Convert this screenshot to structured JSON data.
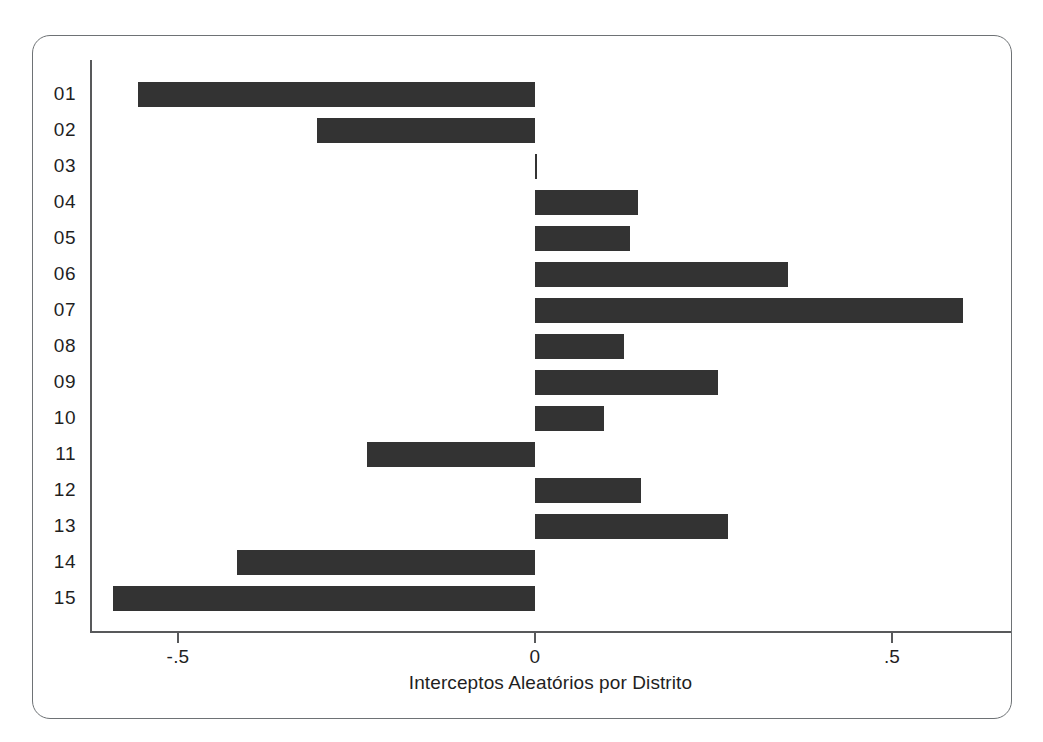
{
  "chart_data": {
    "type": "bar",
    "orientation": "horizontal",
    "title": "",
    "xlabel": "Interceptos Aleatórios por Distrito",
    "ylabel": "",
    "categories": [
      "01",
      "02",
      "03",
      "04",
      "05",
      "06",
      "07",
      "08",
      "09",
      "10",
      "11",
      "12",
      "13",
      "14",
      "15"
    ],
    "values": [
      -0.556,
      -0.305,
      0.003,
      0.144,
      0.133,
      0.354,
      0.6,
      0.125,
      0.256,
      0.097,
      -0.235,
      0.148,
      0.27,
      -0.417,
      -0.591
    ],
    "xlim": [
      -0.625,
      0.67
    ],
    "xticks": [
      -0.5,
      0,
      0.5
    ],
    "xtick_labels": [
      "-.5",
      "0",
      ".5"
    ],
    "grid": false,
    "legend": null,
    "bar_color": "#333333",
    "axis_color": "#58595b",
    "frame_color": "#6e7275",
    "background": "#ffffff"
  }
}
